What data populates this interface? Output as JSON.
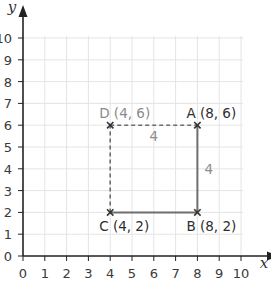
{
  "axes": {
    "x_name": "x",
    "y_name": "y",
    "x_ticks": [
      "0",
      "1",
      "2",
      "3",
      "4",
      "5",
      "6",
      "7",
      "8",
      "9",
      "10"
    ],
    "y_ticks": [
      "0",
      "1",
      "2",
      "3",
      "4",
      "5",
      "6",
      "7",
      "8",
      "9",
      "10"
    ],
    "range": {
      "x": [
        0,
        10
      ],
      "y": [
        0,
        10
      ]
    }
  },
  "points": [
    {
      "id": "A",
      "x": 8,
      "y": 6,
      "label": "A (8, 6)"
    },
    {
      "id": "B",
      "x": 8,
      "y": 2,
      "label": "B (8, 2)"
    },
    {
      "id": "C",
      "x": 4,
      "y": 2,
      "label": "C (4, 2)"
    },
    {
      "id": "D",
      "x": 4,
      "y": 6,
      "label": "D (4, 6)"
    }
  ],
  "segments": [
    {
      "from": "D",
      "to": "A",
      "style": "dashed",
      "length_label": "4"
    },
    {
      "from": "A",
      "to": "B",
      "style": "solid",
      "length_label": "4"
    },
    {
      "from": "B",
      "to": "C",
      "style": "solid",
      "length_label": ""
    },
    {
      "from": "C",
      "to": "D",
      "style": "dashed",
      "length_label": ""
    }
  ],
  "colors": {
    "grid": "#e4e4e4",
    "axis": "#222222",
    "solid_line": "#6e6e6e",
    "dashed_line": "#6e6e6e",
    "dim_label": "#8a8a8a"
  }
}
